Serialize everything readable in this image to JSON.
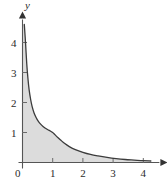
{
  "chart_data": {
    "type": "area",
    "title": "",
    "xlabel": "x",
    "ylabel": "y",
    "xlim": [
      0,
      4.4
    ],
    "ylim": [
      0,
      4.7
    ],
    "grid": false,
    "legend": null,
    "x_ticks": [
      0,
      1,
      2,
      3,
      4
    ],
    "x_tick_labels": [
      "0",
      "1",
      "2",
      "3",
      "4"
    ],
    "y_ticks": [
      1,
      2,
      3,
      4
    ],
    "y_tick_labels": [
      "1",
      "2",
      "3",
      "4"
    ],
    "origin_label": "0",
    "shaded_region": {
      "fill_color": "#dcdcdc",
      "description": "region between curve and x-axis"
    },
    "curve_color": "#3b3b3b",
    "axis_color": "#555555",
    "series": [
      {
        "name": "curve",
        "x": [
          0.06,
          0.1,
          0.14,
          0.18,
          0.22,
          0.27,
          0.32,
          0.38,
          0.45,
          0.52,
          0.6,
          0.68,
          0.76,
          0.84,
          0.92,
          1.0,
          1.08,
          1.16,
          1.26,
          1.4,
          1.55,
          1.75,
          2.0,
          2.25,
          2.5,
          2.8,
          3.1,
          3.4,
          3.7,
          4.0,
          4.25
        ],
        "y": [
          4.6,
          4.0,
          3.3,
          2.8,
          2.42,
          2.1,
          1.86,
          1.66,
          1.5,
          1.38,
          1.28,
          1.2,
          1.14,
          1.09,
          1.05,
          1.0,
          0.92,
          0.84,
          0.75,
          0.63,
          0.53,
          0.43,
          0.34,
          0.27,
          0.22,
          0.17,
          0.13,
          0.1,
          0.08,
          0.06,
          0.05
        ]
      }
    ]
  },
  "labels": {
    "x_axis_name": "x",
    "y_axis_name": "y"
  },
  "icons": {
    "x_arrow": "arrow-right",
    "y_arrow": "arrow-up"
  }
}
